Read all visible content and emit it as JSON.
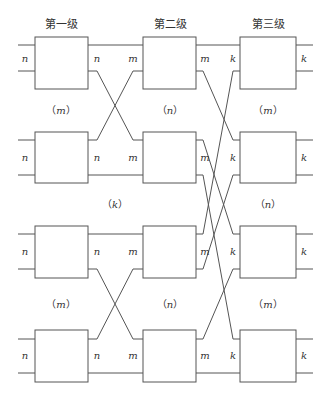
{
  "stages": [
    {
      "title": "第一级",
      "input_label": "n",
      "output_label": "n",
      "between": [
        {
          "label": "m"
        },
        {
          "label": "k"
        },
        {
          "label": "m"
        }
      ]
    },
    {
      "title": "第二级",
      "input_label": "m",
      "output_label": "m",
      "between": [
        {
          "label": "n"
        },
        {
          "label": "n"
        }
      ]
    },
    {
      "title": "第三级",
      "input_label": "k",
      "output_label": "k",
      "between": [
        {
          "label": "m"
        },
        {
          "label": "n"
        },
        {
          "label": "m"
        }
      ]
    }
  ],
  "counts": {
    "stage1_modules": "m",
    "stage2_modules": "k",
    "stage3_modules": "m",
    "stage2_left": "n",
    "stage2_right": "n",
    "stage3_upper": "m",
    "stage3_middle": "n",
    "stage3_lower": "m"
  },
  "colors": {
    "line": "#555555",
    "text": "#333333",
    "background": "#ffffff"
  }
}
